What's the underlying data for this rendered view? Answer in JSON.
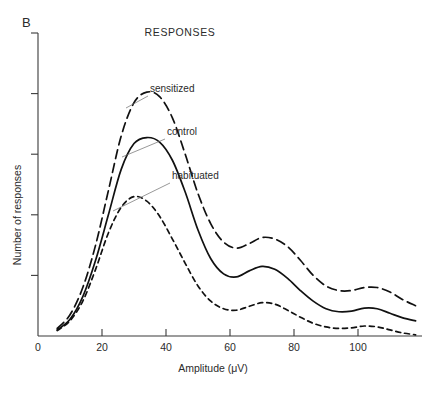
{
  "figure": {
    "panel_letter": "B",
    "title": "RESPONSES",
    "background_color": "#ffffff",
    "ink_color": "#111111"
  },
  "chart_data": {
    "type": "line",
    "title": "RESPONSES",
    "xlabel": "Amplitude (μV)",
    "ylabel": "Number of responses",
    "xlim": [
      0,
      120
    ],
    "ylim": [
      0,
      10
    ],
    "xticks": [
      0,
      20,
      40,
      60,
      80,
      100
    ],
    "xtick_labels": [
      "0",
      "20",
      "40",
      "60",
      "80",
      "100"
    ],
    "yticks": [
      2,
      4,
      6,
      8,
      10
    ],
    "ytick_labels": [
      "",
      "",
      "",
      "",
      ""
    ],
    "grid": false,
    "legend": "inline-annotations",
    "series": [
      {
        "name": "sensitized",
        "label": "sensitized",
        "linestyle": "long-dash",
        "dash_pattern": "9,5",
        "x": [
          6,
          10,
          14,
          18,
          22,
          26,
          30,
          34,
          38,
          42,
          46,
          50,
          54,
          58,
          62,
          66,
          70,
          74,
          78,
          82,
          86,
          90,
          94,
          98,
          102,
          106,
          110,
          114,
          118
        ],
        "y": [
          0.25,
          0.7,
          1.6,
          3.0,
          4.8,
          6.6,
          7.7,
          8.05,
          7.9,
          7.2,
          6.0,
          4.7,
          3.7,
          3.1,
          2.9,
          3.05,
          3.25,
          3.2,
          2.95,
          2.5,
          2.0,
          1.65,
          1.5,
          1.5,
          1.6,
          1.6,
          1.45,
          1.2,
          1.0
        ]
      },
      {
        "name": "control",
        "label": "control",
        "linestyle": "solid",
        "dash_pattern": "none",
        "x": [
          6,
          10,
          14,
          18,
          22,
          26,
          30,
          34,
          38,
          42,
          46,
          50,
          54,
          58,
          62,
          66,
          70,
          74,
          78,
          82,
          86,
          90,
          94,
          98,
          102,
          106,
          110,
          114,
          118
        ],
        "y": [
          0.2,
          0.55,
          1.3,
          2.5,
          4.0,
          5.5,
          6.35,
          6.55,
          6.4,
          5.8,
          4.75,
          3.5,
          2.55,
          2.05,
          1.95,
          2.15,
          2.3,
          2.2,
          1.9,
          1.5,
          1.15,
          0.9,
          0.8,
          0.82,
          0.92,
          0.9,
          0.75,
          0.6,
          0.5
        ]
      },
      {
        "name": "habituated",
        "label": "habituated",
        "linestyle": "short-dash",
        "dash_pattern": "5,4",
        "x": [
          6,
          10,
          14,
          18,
          22,
          26,
          30,
          34,
          38,
          42,
          46,
          50,
          54,
          58,
          62,
          66,
          70,
          74,
          78,
          82,
          86,
          90,
          94,
          98,
          102,
          106,
          110,
          114,
          118
        ],
        "y": [
          0.18,
          0.5,
          1.15,
          2.2,
          3.4,
          4.25,
          4.6,
          4.45,
          3.95,
          3.2,
          2.4,
          1.65,
          1.15,
          0.9,
          0.85,
          0.98,
          1.1,
          1.05,
          0.85,
          0.62,
          0.42,
          0.3,
          0.25,
          0.27,
          0.33,
          0.3,
          0.2,
          0.1,
          0.04
        ]
      }
    ],
    "annotations": [
      {
        "text": "sensitized",
        "label_x": 150,
        "label_y": 92,
        "leader_from_x": 148,
        "leader_from_y": 96,
        "leader_to_x": 126,
        "leader_to_y": 108
      },
      {
        "text": "control",
        "label_x": 167,
        "label_y": 135,
        "leader_from_x": 165,
        "leader_from_y": 139,
        "leader_to_x": 122,
        "leader_to_y": 157
      },
      {
        "text": "habituated",
        "label_x": 172,
        "label_y": 179,
        "leader_from_x": 170,
        "leader_from_y": 183,
        "leader_to_x": 113,
        "leader_to_y": 211
      }
    ]
  }
}
